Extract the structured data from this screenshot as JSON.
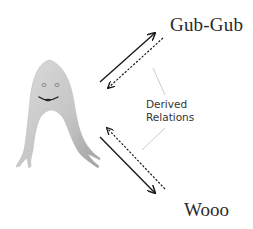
{
  "diagram": {
    "nodes": {
      "top_right": {
        "label": "Gub-Gub"
      },
      "bottom_right": {
        "label": "Wooo"
      },
      "left": {
        "label": "",
        "kind": "ghost-creature-figure"
      }
    },
    "annotation": {
      "line1": "Derived",
      "line2": "Relations"
    },
    "edges": [
      {
        "from": "creature",
        "to": "Gub-Gub",
        "style": "solid",
        "meaning": "trained relation"
      },
      {
        "from": "Gub-Gub",
        "to": "creature",
        "style": "dashed",
        "meaning": "derived relation"
      },
      {
        "from": "creature",
        "to": "Wooo",
        "style": "solid",
        "meaning": "trained relation"
      },
      {
        "from": "Wooo",
        "to": "creature",
        "style": "dashed",
        "meaning": "derived relation"
      }
    ],
    "colors": {
      "arrow": "#1a1a1a",
      "pointer_line": "#cccccc",
      "creature_fill_light": "#d9d9d9",
      "creature_fill_dark": "#a9a9a9",
      "text": "#2a2a2a"
    }
  }
}
